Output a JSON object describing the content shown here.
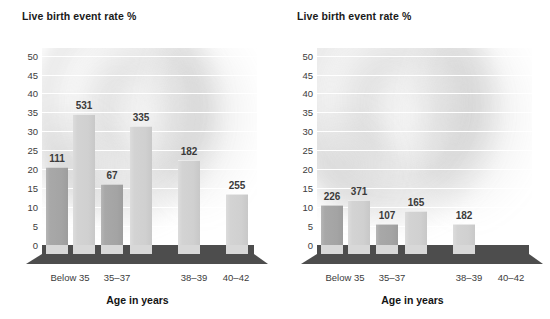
{
  "figure": {
    "panels": [
      {
        "id": "left-chart",
        "ylabel": "Live birth event rate %",
        "xlabel": "Age in years"
      },
      {
        "id": "right-chart",
        "ylabel": "Live birth event rate %",
        "xlabel": "Age in years"
      }
    ]
  },
  "chart_data": [
    {
      "type": "bar",
      "id": "left-chart",
      "title": "",
      "ylabel": "Live birth event rate %",
      "xlabel": "Age in years",
      "ylim": [
        0,
        52
      ],
      "yticks": [
        0,
        5,
        10,
        15,
        20,
        25,
        30,
        35,
        40,
        45,
        50
      ],
      "ytick_labels": [
        "0",
        "5",
        "10",
        "15",
        "20",
        "25",
        "30",
        "35",
        "40",
        "45",
        "50"
      ],
      "grid": true,
      "legend": "none",
      "categories": [
        "Below 35",
        "35–37",
        "38–39",
        "40–42"
      ],
      "bars": [
        {
          "label": "111",
          "value": 20.5,
          "color": "dark",
          "group": "Below 35"
        },
        {
          "label": "531",
          "value": 34.5,
          "color": "light",
          "group": "Below 35"
        },
        {
          "label": "67",
          "value": 16.0,
          "color": "dark",
          "group": "35–37"
        },
        {
          "label": "335",
          "value": 31.5,
          "color": "light",
          "group": "35–37"
        },
        {
          "label": "182",
          "value": 22.5,
          "color": "light",
          "group": "38–39"
        },
        {
          "label": "255",
          "value": 13.5,
          "color": "light",
          "group": "40–42"
        }
      ]
    },
    {
      "type": "bar",
      "id": "right-chart",
      "title": "",
      "ylabel": "Live birth event rate %",
      "xlabel": "Age in years",
      "ylim": [
        0,
        52
      ],
      "yticks": [
        0,
        5,
        10,
        15,
        20,
        25,
        30,
        35,
        40,
        45,
        50
      ],
      "ytick_labels": [
        "0",
        "5",
        "10",
        "15",
        "20",
        "25",
        "30",
        "35",
        "40",
        "45",
        "50"
      ],
      "grid": true,
      "legend": "none",
      "categories": [
        "Below 35",
        "35–37",
        "38–39",
        "40–42"
      ],
      "bars": [
        {
          "label": "226",
          "value": 10.5,
          "color": "dark",
          "group": "Below 35"
        },
        {
          "label": "371",
          "value": 12.0,
          "color": "light",
          "group": "Below 35"
        },
        {
          "label": "107",
          "value": 5.5,
          "color": "dark",
          "group": "35–37"
        },
        {
          "label": "165",
          "value": 9.0,
          "color": "light",
          "group": "35–37"
        },
        {
          "label": "182",
          "value": 5.5,
          "color": "light",
          "group": "38–39"
        }
      ]
    }
  ],
  "colors": {
    "bar_dark": "#a4a4a4",
    "bar_light": "#d0d0d0",
    "floor": "#4d4d4d",
    "gridline": "#ffffff",
    "text": "#3c3c3c",
    "title_text": "#141414"
  }
}
